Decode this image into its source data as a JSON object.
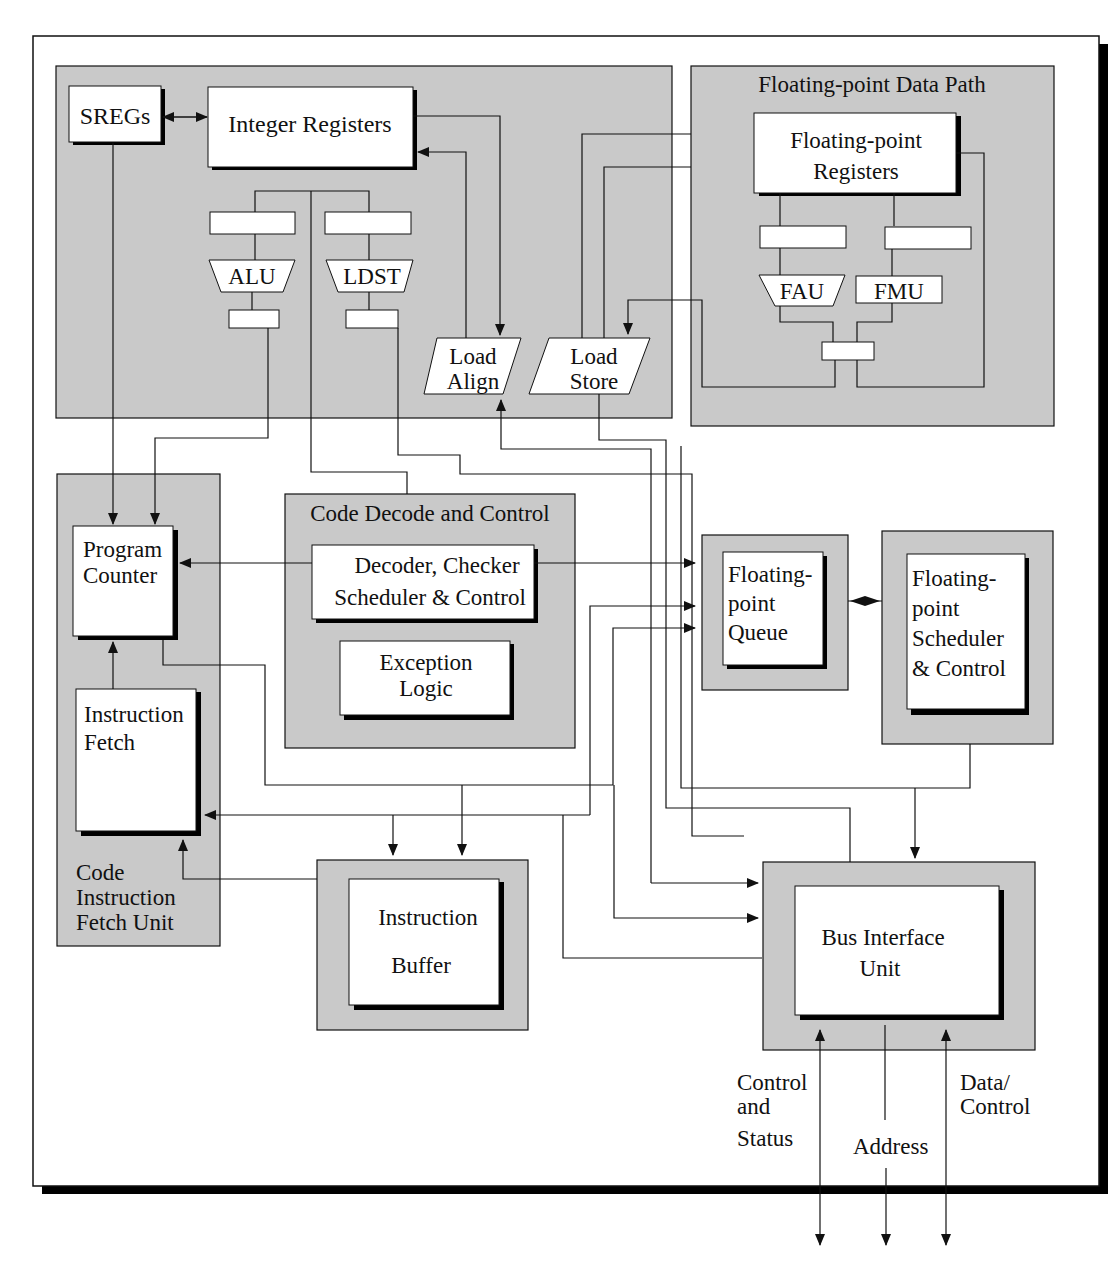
{
  "diagram": {
    "colors": {
      "panel": "#c9c9c9",
      "box": "#ffffff",
      "line": "#111111",
      "shadow": "#000000"
    },
    "integer_path": {
      "sregs": "SREGs",
      "integer_registers": "Integer Registers",
      "alu": "ALU",
      "ldst": "LDST",
      "load_align": [
        "Load",
        "Align"
      ],
      "load_store": [
        "Load",
        "Store"
      ]
    },
    "fp_path": {
      "title": "Floating-point Data Path",
      "registers": [
        "Floating-point",
        "Registers"
      ],
      "fau": "FAU",
      "fmu": "FMU"
    },
    "fetch_unit": {
      "title": [
        "Code",
        "Instruction",
        "Fetch Unit"
      ],
      "program_counter": [
        "Program",
        "Counter"
      ],
      "instruction_fetch": [
        "Instruction",
        "Fetch"
      ]
    },
    "decode": {
      "title": "Code Decode and Control",
      "decoder": [
        "Decoder, Checker",
        "Scheduler & Control"
      ],
      "exception": [
        "Exception",
        "Logic"
      ]
    },
    "fp_queue": [
      "Floating-",
      "point",
      "Queue"
    ],
    "fp_scheduler": [
      "Floating-",
      "point",
      "Scheduler",
      "& Control"
    ],
    "instruction_buffer": [
      "Instruction",
      "Buffer"
    ],
    "bus_interface": [
      "Bus Interface",
      "Unit"
    ],
    "bus_signals": {
      "control_status": [
        "Control",
        "and",
        "Status"
      ],
      "address": "Address",
      "data_control": [
        "Data/",
        "Control"
      ]
    }
  }
}
